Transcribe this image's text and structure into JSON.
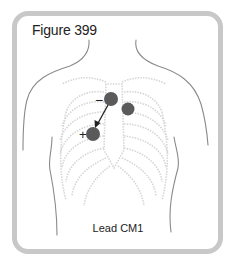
{
  "figure": {
    "title": "Figure 399",
    "caption": "Lead CM1",
    "colors": {
      "frame": "#c8c8c8",
      "outline": "#8a8a8a",
      "ribs": "#d8d8d8",
      "electrode": "#5a5a5a",
      "arrow": "#222222"
    },
    "electrodes": [
      {
        "name": "negative",
        "sign": "−",
        "cx": 111,
        "cy": 99,
        "r": 7
      },
      {
        "name": "ground",
        "sign": "",
        "cx": 128,
        "cy": 109,
        "r": 6.5
      },
      {
        "name": "positive",
        "sign": "+",
        "cx": 93,
        "cy": 134,
        "r": 7
      }
    ],
    "signs": {
      "negative": "−",
      "positive": "+"
    }
  }
}
